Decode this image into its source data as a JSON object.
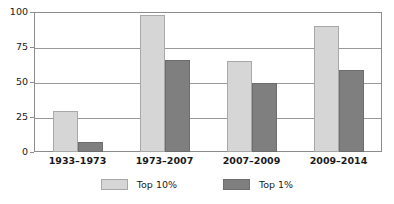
{
  "chart_data": {
    "type": "bar",
    "title": "",
    "subtitle": "",
    "xlabel": "",
    "ylabel": "",
    "ylim": [
      0,
      100
    ],
    "yticks": [
      0,
      25,
      50,
      75,
      100
    ],
    "grid": true,
    "legend_position": "bottom-center",
    "categories": [
      "1933–1973",
      "1973–2007",
      "2007–2009",
      "2009–2014"
    ],
    "series": [
      {
        "name": "Top 10%",
        "color": "#d6d6d6",
        "values": [
          29,
          98,
          65,
          90
        ]
      },
      {
        "name": "Top 1%",
        "color": "#7f7f7f",
        "values": [
          7,
          66,
          49,
          58.5
        ]
      }
    ]
  },
  "axis": {
    "ytick_labels": [
      "100",
      "75",
      "50",
      "25",
      "0"
    ]
  },
  "legend": {
    "items": [
      {
        "label": "Top 10%",
        "swatch": "light-gray-swatch"
      },
      {
        "label": "Top 1%",
        "swatch": "dark-gray-swatch"
      }
    ]
  }
}
